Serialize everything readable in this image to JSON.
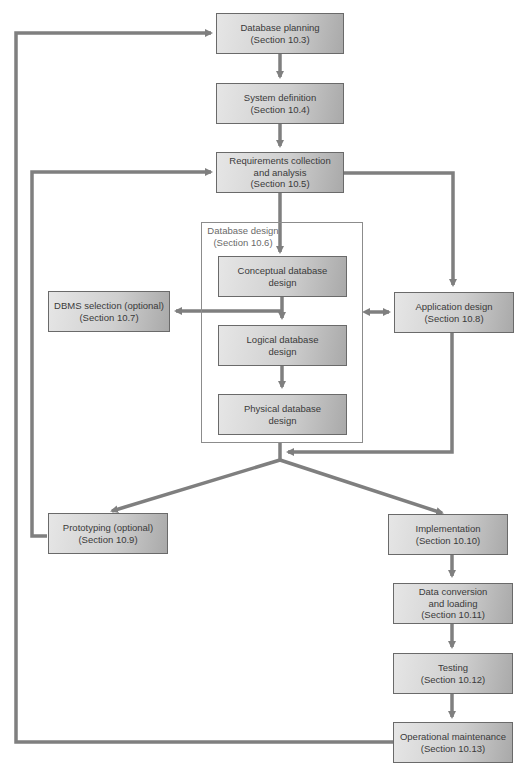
{
  "diagram": {
    "colors": {
      "line": "#7f7f7f",
      "box_border": "#6a6a6a",
      "text": "#3a3a3a"
    },
    "nodes": {
      "db_planning": {
        "line1": "Database planning",
        "line2": "(Section 10.3)"
      },
      "system_definition": {
        "line1": "System definition",
        "line2": "(Section 10.4)"
      },
      "requirements": {
        "line1": "Requirements collection",
        "line2": "and analysis",
        "line3": "(Section 10.5)"
      },
      "db_design_group": {
        "line1": "Database design",
        "line2": "(Section 10.6)"
      },
      "conceptual": {
        "line1": "Conceptual database",
        "line2": "design"
      },
      "logical": {
        "line1": "Logical database",
        "line2": "design"
      },
      "physical": {
        "line1": "Physical database",
        "line2": "design"
      },
      "dbms_selection": {
        "line1": "DBMS selection (optional)",
        "line2": "(Section 10.7)"
      },
      "application_design": {
        "line1": "Application design",
        "line2": "(Section 10.8)"
      },
      "prototyping": {
        "line1": "Prototyping (optional)",
        "line2": "(Section 10.9)"
      },
      "implementation": {
        "line1": "Implementation",
        "line2": "(Section 10.10)"
      },
      "data_conversion": {
        "line1": "Data conversion",
        "line2": "and loading",
        "line3": "(Section 10.11)"
      },
      "testing": {
        "line1": "Testing",
        "line2": "(Section 10.12)"
      },
      "operational_maintenance": {
        "line1": "Operational maintenance",
        "line2": "(Section 10.13)"
      }
    },
    "edges": [
      {
        "from": "db_planning",
        "to": "system_definition"
      },
      {
        "from": "system_definition",
        "to": "requirements"
      },
      {
        "from": "requirements",
        "to": "conceptual"
      },
      {
        "from": "requirements",
        "to": "application_design"
      },
      {
        "from": "conceptual",
        "to": "logical"
      },
      {
        "from": "conceptual",
        "to": "dbms_selection"
      },
      {
        "from": "logical",
        "to": "physical"
      },
      {
        "from": "db_design_group",
        "to": "application_design",
        "bidirectional": true
      },
      {
        "from": "db_design_group",
        "to": "prototyping"
      },
      {
        "from": "db_design_group",
        "to": "implementation"
      },
      {
        "from": "application_design",
        "to": "prototyping"
      },
      {
        "from": "application_design",
        "to": "implementation"
      },
      {
        "from": "prototyping",
        "to": "requirements"
      },
      {
        "from": "implementation",
        "to": "data_conversion"
      },
      {
        "from": "data_conversion",
        "to": "testing"
      },
      {
        "from": "testing",
        "to": "operational_maintenance"
      },
      {
        "from": "operational_maintenance",
        "to": "db_planning"
      }
    ]
  }
}
